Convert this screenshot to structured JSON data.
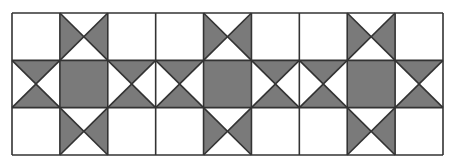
{
  "diagram": {
    "grid": {
      "columns": 9,
      "rows": 3,
      "left": 12,
      "top": 13,
      "right": 443,
      "bottom": 155
    },
    "colors": {
      "fill": "#7a7a7a",
      "background": "#ffffff",
      "line": "#333333"
    },
    "blocks": 3,
    "block_layout": [
      [
        "blank",
        "hourglass-lr",
        "blank"
      ],
      [
        "hourglass-tb",
        "solid",
        "hourglass-tb"
      ],
      [
        "blank",
        "hourglass-lr",
        "blank"
      ]
    ]
  }
}
